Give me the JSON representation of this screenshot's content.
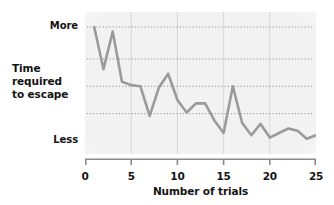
{
  "chart_data": {
    "type": "line",
    "title": "",
    "xlabel": "Number of trials",
    "ylabel": "Time required to escape",
    "ylabel_lines": [
      "Time",
      "required",
      "to escape"
    ],
    "y_tick_labels": [
      "More",
      "Less"
    ],
    "y_top_label": "More",
    "y_bottom_label": "Less",
    "ylim": [
      0,
      100
    ],
    "xlim": [
      0,
      25
    ],
    "x_tick_labels": [
      "0",
      "5",
      "10",
      "15",
      "20",
      "25"
    ],
    "x_ticks": [
      0,
      5,
      10,
      15,
      20,
      25
    ],
    "grid": {
      "horizontal": true,
      "horizontal_style": "dotted",
      "horizontal_count": 4,
      "horizontal_values": [
        100,
        72,
        48,
        24
      ],
      "vertical": true,
      "vertical_style": "solid",
      "vertical_values": [
        5,
        10,
        15,
        20
      ]
    },
    "legend": "none",
    "line_color": "#9b9b9b",
    "line_width": 2.6,
    "plot_background": "#f2f2f2",
    "x": [
      1,
      2,
      3,
      4,
      5,
      6,
      7,
      8,
      9,
      10,
      11,
      12,
      13,
      14,
      15,
      16,
      17,
      18,
      19,
      20,
      21,
      22,
      23,
      24,
      25
    ],
    "values": [
      100,
      63,
      96,
      52,
      49,
      48,
      22,
      47,
      59,
      36,
      25,
      33,
      33,
      18,
      7,
      48,
      16,
      5,
      15,
      3,
      7,
      11,
      9,
      2,
      5
    ],
    "series": [
      {
        "name": "Time required to escape",
        "values": [
          100,
          63,
          96,
          52,
          49,
          48,
          22,
          47,
          59,
          36,
          25,
          33,
          33,
          18,
          7,
          48,
          16,
          5,
          15,
          3,
          7,
          11,
          9,
          2,
          5
        ]
      }
    ]
  }
}
